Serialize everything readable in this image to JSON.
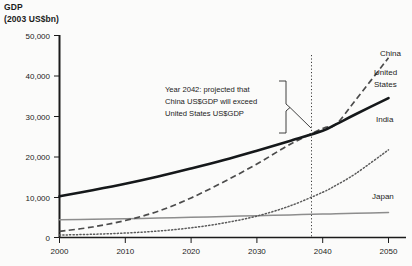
{
  "chart_data": {
    "type": "line",
    "title": "GDP",
    "subtitle": "(2003 US$bn)",
    "ylabel": "GDP (2003 US$bn)",
    "xlabel": "",
    "xlim": [
      2000,
      2050
    ],
    "ylim": [
      0,
      50000
    ],
    "grid": false,
    "legend_position": "inline-right-labels",
    "ytick_labels": [
      "0",
      "10,000",
      "20,000",
      "30,000",
      "40,000",
      "50,000"
    ],
    "ytick_values": [
      0,
      10000,
      20000,
      30000,
      40000,
      50000
    ],
    "xtick_labels": [
      "2000",
      "2010",
      "2020",
      "2030",
      "2040",
      "2050"
    ],
    "xtick_values": [
      2000,
      2010,
      2020,
      2030,
      2040,
      2050
    ],
    "x": [
      2000,
      2005,
      2010,
      2015,
      2020,
      2025,
      2030,
      2035,
      2040,
      2042,
      2045,
      2050
    ],
    "series": [
      {
        "name": "China",
        "style": "dashed",
        "values": [
          1500,
          2600,
          4200,
          6500,
          9800,
          13800,
          18200,
          23000,
          27000,
          28000,
          34000,
          44500
        ]
      },
      {
        "name": "United States",
        "style": "solid-thick",
        "values": [
          10200,
          11700,
          13300,
          15100,
          17100,
          19200,
          21500,
          23900,
          26400,
          28000,
          30500,
          34500
        ]
      },
      {
        "name": "India",
        "style": "dotted",
        "values": [
          600,
          800,
          1100,
          1600,
          2400,
          3600,
          5300,
          7800,
          11200,
          12900,
          15800,
          21700
        ]
      },
      {
        "name": "Japan",
        "style": "thin-solid",
        "values": [
          4400,
          4500,
          4650,
          4800,
          5000,
          5200,
          5400,
          5600,
          5800,
          5850,
          6000,
          6200
        ]
      }
    ],
    "annotations": [
      {
        "name": "crossover-callout",
        "lines": [
          "Year 2042: projected that",
          "China US$GDP will exceed",
          "United States US$GDP"
        ],
        "marker_year": 2042,
        "marker_value": 28000
      }
    ],
    "series_labels": {
      "china": "China",
      "united_states_line1": "United",
      "united_states_line2": "States",
      "india": "India",
      "japan": "Japan"
    }
  }
}
